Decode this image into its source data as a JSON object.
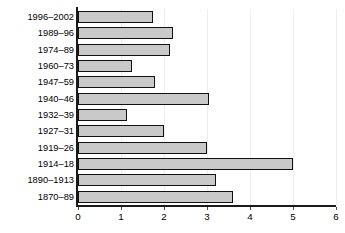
{
  "chart_data": {
    "type": "bar",
    "orientation": "horizontal",
    "title": "",
    "subtitle": "",
    "xlabel": "",
    "ylabel": "",
    "xlim": [
      0,
      6
    ],
    "ylim": null,
    "grid": true,
    "grid_axis": "x",
    "legend": false,
    "legend_position": "none",
    "xticks": [
      0,
      1,
      2,
      3,
      4,
      5,
      6
    ],
    "xtick_labels": [
      "0",
      "1",
      "2",
      "3",
      "4",
      "5",
      "6"
    ],
    "categories": [
      "1996–2002",
      "1989–96",
      "1974–89",
      "1960–73",
      "1947–59",
      "1940–46",
      "1932–39",
      "1927–31",
      "1919–26",
      "1914–18",
      "1890–1913",
      "1870–89"
    ],
    "values": [
      1.75,
      2.2,
      2.15,
      1.25,
      1.8,
      3.05,
      1.15,
      2.0,
      3.0,
      5.0,
      3.2,
      3.6
    ],
    "series": [
      {
        "name": "",
        "values": [
          1.75,
          2.2,
          2.15,
          1.25,
          1.8,
          3.05,
          1.15,
          2.0,
          3.0,
          5.0,
          3.2,
          3.6
        ]
      }
    ]
  },
  "style": {
    "bar_fill": "#c9c9c9",
    "bar_border": "#111111",
    "axis_color": "#1a1a1a",
    "grid_color": "#ededed",
    "background": "#ffffff",
    "text_color": "#000000"
  }
}
